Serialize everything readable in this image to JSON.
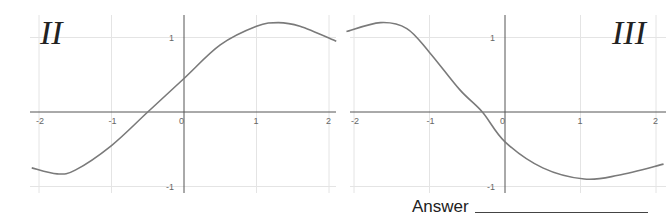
{
  "labels": {
    "left_graph": "II",
    "right_graph": "III",
    "answer": "Answer"
  },
  "colors": {
    "curve": "#7a7a7a",
    "axis": "#555555",
    "grid": "#e4e4e4",
    "tick_text": "#666666"
  },
  "chart_data": [
    {
      "type": "line",
      "title": "II",
      "xlim": [
        -2.1,
        2.1
      ],
      "ylim": [
        -1.05,
        1.3
      ],
      "xticks": [
        -2,
        -1,
        0,
        1,
        2
      ],
      "yticks": [
        -1,
        1
      ],
      "grid": true,
      "x": [
        -2.1,
        -1.75,
        -1.5,
        -1.0,
        -0.5,
        0,
        0.5,
        1.0,
        1.3,
        1.6,
        2.1
      ],
      "y": [
        -0.75,
        -0.83,
        -0.78,
        -0.45,
        0.0,
        0.45,
        0.9,
        1.15,
        1.2,
        1.15,
        0.95
      ]
    },
    {
      "type": "line",
      "title": "III",
      "xlim": [
        -2.1,
        2.1
      ],
      "ylim": [
        -1.05,
        1.3
      ],
      "xticks": [
        -2,
        -1,
        0,
        1,
        2
      ],
      "yticks": [
        -1,
        1
      ],
      "grid": true,
      "x": [
        -2.1,
        -1.65,
        -1.3,
        -1.0,
        -0.6,
        -0.3,
        0,
        0.5,
        1.05,
        1.5,
        2.1
      ],
      "y": [
        1.08,
        1.2,
        1.12,
        0.8,
        0.3,
        0.0,
        -0.4,
        -0.75,
        -0.9,
        -0.85,
        -0.7
      ]
    }
  ]
}
